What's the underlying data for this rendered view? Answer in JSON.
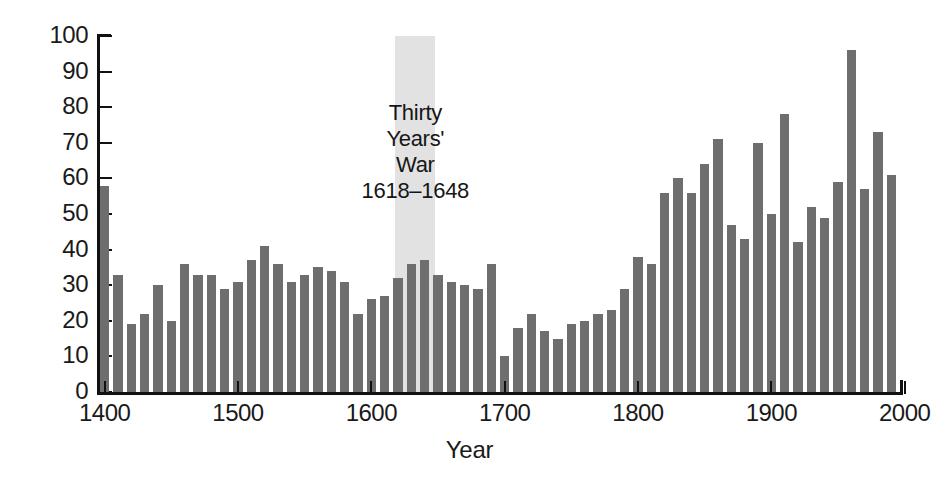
{
  "chart_data": {
    "type": "bar",
    "title": "",
    "subtitle": "",
    "xlabel": "Year",
    "ylabel": "",
    "xlim": [
      1395,
      1995
    ],
    "ylim": [
      0,
      100
    ],
    "grid": false,
    "legend": "none",
    "bar_color": "#6e6e6e",
    "axis_color": "#111111",
    "band_color": "#e2e2e2",
    "x_tick_labels": [
      "1400",
      "1500",
      "1600",
      "1700",
      "1800",
      "1900",
      "2000"
    ],
    "x_tick_values": [
      1400,
      1500,
      1600,
      1700,
      1800,
      1900,
      2000
    ],
    "y_tick_labels": [
      "0",
      "10",
      "20",
      "30",
      "40",
      "50",
      "60",
      "70",
      "80",
      "90",
      "100"
    ],
    "y_tick_values": [
      0,
      10,
      20,
      30,
      40,
      50,
      60,
      70,
      80,
      90,
      100
    ],
    "categories": [
      1400,
      1410,
      1420,
      1430,
      1440,
      1450,
      1460,
      1470,
      1480,
      1490,
      1500,
      1510,
      1520,
      1530,
      1540,
      1550,
      1560,
      1570,
      1580,
      1590,
      1600,
      1610,
      1620,
      1630,
      1640,
      1650,
      1660,
      1670,
      1680,
      1690,
      1700,
      1710,
      1720,
      1730,
      1740,
      1750,
      1760,
      1770,
      1780,
      1790,
      1800,
      1810,
      1820,
      1830,
      1840,
      1850,
      1860,
      1870,
      1880,
      1890,
      1900,
      1910,
      1920,
      1930,
      1940,
      1950,
      1960,
      1970,
      1980,
      1990
    ],
    "values": [
      58,
      33,
      19,
      22,
      30,
      20,
      36,
      33,
      33,
      29,
      31,
      37,
      41,
      36,
      31,
      33,
      35,
      34,
      31,
      22,
      26,
      27,
      32,
      36,
      37,
      33,
      31,
      30,
      29,
      36,
      10,
      18,
      22,
      17,
      15,
      19,
      20,
      22,
      23,
      29,
      38,
      36,
      56,
      60,
      56,
      64,
      71,
      47,
      43,
      70,
      50,
      78,
      42,
      52,
      49,
      59,
      96,
      57,
      73,
      61
    ],
    "annotations": [
      {
        "name": "thirty-years-war",
        "text": "Thirty\nYears'\nWar\n1618–1648",
        "band_start": 1618,
        "band_end": 1648
      }
    ]
  },
  "annotation": {
    "line1": "Thirty",
    "line2": "Years'",
    "line3": "War",
    "line4": "1618–1648"
  },
  "axes": {
    "x_label": "Year"
  }
}
